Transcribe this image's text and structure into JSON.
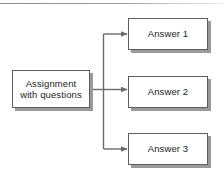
{
  "diagram": {
    "background_color": "#ffffff",
    "line_color": "#6b6b6b",
    "border_color": "#5d5d5d",
    "shadow_color": "#9a9a9a",
    "text_color": "#232323",
    "nodes": [
      {
        "id": "assignment",
        "label": "Assignment\nwith questions",
        "shape": "rectangle"
      },
      {
        "id": "answer-1",
        "label": "Answer 1",
        "shape": "rectangle"
      },
      {
        "id": "answer-2",
        "label": "Answer 2",
        "shape": "rectangle"
      },
      {
        "id": "answer-3",
        "label": "Answer 3",
        "shape": "rectangle"
      }
    ],
    "edges": [
      {
        "from": "assignment",
        "to": "answer-1",
        "arrow": "single",
        "style": "elbow"
      },
      {
        "from": "assignment",
        "to": "answer-2",
        "arrow": "single",
        "style": "straight"
      },
      {
        "from": "assignment",
        "to": "answer-3",
        "arrow": "single",
        "style": "elbow"
      }
    ]
  }
}
